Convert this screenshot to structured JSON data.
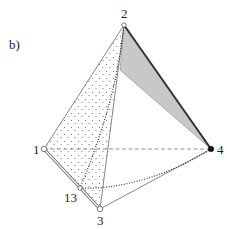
{
  "panel_label": "b)",
  "vertices": [
    {
      "id": "1",
      "label": "1",
      "x": 44,
      "y": 149,
      "marker": "open-circle"
    },
    {
      "id": "2",
      "label": "2",
      "x": 124,
      "y": 25,
      "marker": "open-circle-small"
    },
    {
      "id": "3",
      "label": "3",
      "x": 100,
      "y": 209,
      "marker": "open-circle"
    },
    {
      "id": "4",
      "label": "4",
      "x": 211,
      "y": 149,
      "marker": "filled-circle"
    },
    {
      "id": "13",
      "label": "13",
      "x": 80,
      "y": 188,
      "marker": "open-circle-small"
    }
  ],
  "edges": [
    {
      "from": "1",
      "to": "2",
      "style": "solid"
    },
    {
      "from": "2",
      "to": "3",
      "style": "solid"
    },
    {
      "from": "3",
      "to": "4",
      "style": "solid"
    },
    {
      "from": "2",
      "to": "4",
      "style": "thick-solid"
    },
    {
      "from": "1",
      "to": "3",
      "style": "double-line"
    },
    {
      "from": "1",
      "to": "4",
      "style": "dashed"
    },
    {
      "from": "2",
      "to": "13",
      "style": "dotted-curve"
    },
    {
      "from": "13",
      "to": "4",
      "style": "dotted-curve"
    }
  ],
  "regions": [
    {
      "name": "stippled-face-1-2-3",
      "fill": "stipple"
    },
    {
      "name": "gray-wedge-2-4",
      "fill": "#c8c8c8"
    }
  ],
  "colors": {
    "line": "#555555",
    "gray_fill": "#c8c8c8",
    "stipple_dot": "#666666",
    "text": "#222222"
  }
}
